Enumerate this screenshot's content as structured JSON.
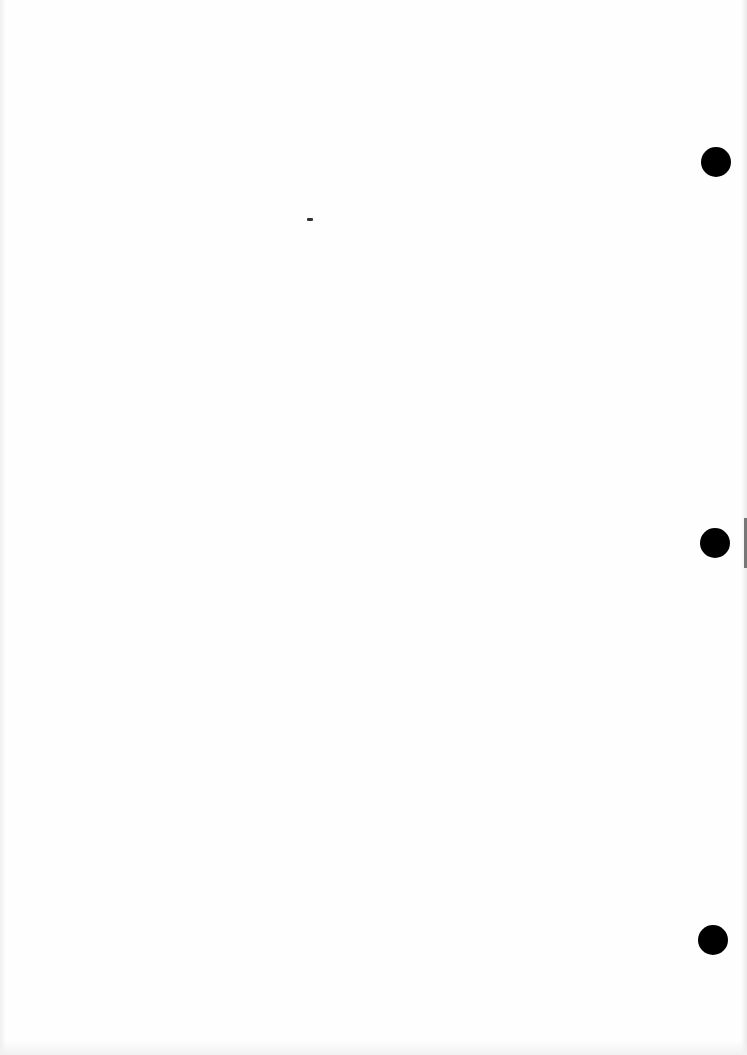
{
  "document": {
    "type": "blank scanned page",
    "text": "",
    "punch_holes": [
      {
        "x": 716,
        "y": 162
      },
      {
        "x": 715,
        "y": 543
      },
      {
        "x": 713,
        "y": 940
      }
    ],
    "specks": [
      {
        "x": 310,
        "y": 219
      }
    ]
  }
}
